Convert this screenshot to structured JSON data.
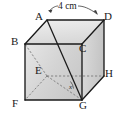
{
  "figure": {
    "kind": "geometry-solid",
    "shape": "cube",
    "background_color": "#ffffff",
    "stroke_color": "#1a1a1a",
    "hidden_edge_style": "dashed",
    "face_fill_top": "#e4e4e4",
    "face_fill_front": "#d9d9d9",
    "face_fill_right": "#cfcfcf",
    "vertices": [
      {
        "id": "A",
        "label": "A",
        "x": 47,
        "y": 20,
        "label_x": 37,
        "label_y": 13,
        "hidden": false
      },
      {
        "id": "D",
        "label": "D",
        "x": 104,
        "y": 20,
        "label_x": 105,
        "label_y": 13,
        "hidden": false
      },
      {
        "id": "B",
        "label": "B",
        "x": 25,
        "y": 44,
        "label_x": 12,
        "label_y": 37,
        "hidden": false
      },
      {
        "id": "C",
        "label": "C",
        "x": 82,
        "y": 44,
        "label_x": 81,
        "label_y": 44,
        "hidden": false
      },
      {
        "id": "E",
        "label": "E",
        "x": 47,
        "y": 76,
        "label_x": 37,
        "label_y": 66,
        "hidden": true
      },
      {
        "id": "H",
        "label": "H",
        "x": 104,
        "y": 76,
        "label_x": 105,
        "label_y": 69,
        "hidden": false
      },
      {
        "id": "F",
        "label": "F",
        "x": 25,
        "y": 100,
        "label_x": 13,
        "label_y": 99,
        "hidden": false
      },
      {
        "id": "G",
        "label": "G",
        "x": 82,
        "y": 100,
        "label_x": 81,
        "label_y": 101,
        "hidden": false
      }
    ],
    "edges": [
      {
        "from": "A",
        "to": "D",
        "hidden": false
      },
      {
        "from": "A",
        "to": "B",
        "hidden": false
      },
      {
        "from": "D",
        "to": "C",
        "hidden": false
      },
      {
        "from": "B",
        "to": "C",
        "hidden": false
      },
      {
        "from": "B",
        "to": "F",
        "hidden": false
      },
      {
        "from": "C",
        "to": "G",
        "hidden": false
      },
      {
        "from": "D",
        "to": "H",
        "hidden": false
      },
      {
        "from": "F",
        "to": "G",
        "hidden": false
      },
      {
        "from": "G",
        "to": "H",
        "hidden": false
      },
      {
        "from": "E",
        "to": "B",
        "hidden": true
      },
      {
        "from": "E",
        "to": "F",
        "hidden": true
      },
      {
        "from": "E",
        "to": "H",
        "hidden": true
      },
      {
        "from": "E",
        "to": "G",
        "hidden": true
      }
    ],
    "diagonals": [
      {
        "from": "A",
        "to": "G",
        "style": "solid"
      }
    ],
    "angle_marks": [
      {
        "at": "G",
        "label": "x",
        "label_x": 71,
        "label_y": 84
      }
    ],
    "dimensions": [
      {
        "id": "top-edge",
        "label": "4 cm",
        "value": 4,
        "unit": "cm",
        "from": "A",
        "to": "D",
        "label_x": 60,
        "label_y": 9
      }
    ]
  }
}
